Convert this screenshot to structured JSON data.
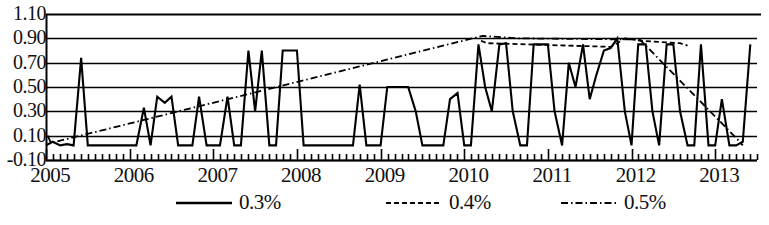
{
  "chart_data": {
    "type": "line",
    "title": "",
    "subtitle": "",
    "xlabel": "",
    "ylabel": "",
    "grid": true,
    "legend_position": "bottom",
    "ylim": [
      -0.1,
      1.1
    ],
    "ytick_labels": [
      "1.10",
      "0.90",
      "0.70",
      "0.50",
      "0.30",
      "0.10",
      "-0.10"
    ],
    "ytick_values": [
      1.1,
      0.9,
      0.7,
      0.5,
      0.3,
      0.1,
      -0.1
    ],
    "xlim": [
      2005.0,
      2013.5
    ],
    "xtick_labels": [
      "2005",
      "2006",
      "2007",
      "2008",
      "2009",
      "2010",
      "2011",
      "2012",
      "2013"
    ],
    "xtick_values": [
      2005,
      2006,
      2007,
      2008,
      2009,
      2010,
      2011,
      2012,
      2013
    ],
    "x_minor_ticks": "monthly",
    "legend": [
      {
        "name": "0.3%",
        "style": "solid",
        "color": "#000000"
      },
      {
        "name": "0.4%",
        "style": "dashed",
        "color": "#000000"
      },
      {
        "name": "0.5%",
        "style": "dash-dot",
        "color": "#000000"
      }
    ],
    "series": [
      {
        "name": "0.3%",
        "style": "solid",
        "color": "#000000",
        "x": [
          2005.0,
          2005.08,
          2005.17,
          2005.25,
          2005.33,
          2005.42,
          2005.5,
          2005.58,
          2005.67,
          2005.75,
          2005.83,
          2005.92,
          2006.0,
          2006.08,
          2006.17,
          2006.25,
          2006.33,
          2006.42,
          2006.5,
          2006.58,
          2006.67,
          2006.75,
          2006.83,
          2006.92,
          2007.0,
          2007.08,
          2007.17,
          2007.25,
          2007.33,
          2007.42,
          2007.5,
          2007.58,
          2007.67,
          2007.75,
          2007.83,
          2007.92,
          2008.0,
          2008.08,
          2008.17,
          2008.25,
          2008.33,
          2008.42,
          2008.5,
          2008.58,
          2008.67,
          2008.75,
          2008.83,
          2008.92,
          2009.0,
          2009.08,
          2009.17,
          2009.25,
          2009.33,
          2009.42,
          2009.5,
          2009.58,
          2009.67,
          2009.75,
          2009.83,
          2009.92,
          2010.0,
          2010.08,
          2010.17,
          2010.25,
          2010.33,
          2010.42,
          2010.5,
          2010.58,
          2010.67,
          2010.75,
          2010.83,
          2010.92,
          2011.0,
          2011.08,
          2011.17,
          2011.25,
          2011.33,
          2011.42,
          2011.5,
          2011.58,
          2011.67,
          2011.75,
          2011.83,
          2011.92,
          2012.0,
          2012.08,
          2012.17,
          2012.25,
          2012.33,
          2012.42,
          2012.5,
          2012.58,
          2012.67,
          2012.75,
          2012.83,
          2012.92,
          2013.0,
          2013.08,
          2013.17,
          2013.25,
          2013.33,
          2013.42
        ],
        "y": [
          0.02,
          0.05,
          0.02,
          0.03,
          0.02,
          0.74,
          0.02,
          0.02,
          0.02,
          0.02,
          0.02,
          0.02,
          0.02,
          0.02,
          0.33,
          0.02,
          0.42,
          0.37,
          0.42,
          0.02,
          0.02,
          0.02,
          0.42,
          0.02,
          0.02,
          0.02,
          0.42,
          0.02,
          0.02,
          0.8,
          0.3,
          0.8,
          0.02,
          0.02,
          0.8,
          0.8,
          0.8,
          0.02,
          0.02,
          0.02,
          0.02,
          0.02,
          0.02,
          0.02,
          0.02,
          0.52,
          0.02,
          0.02,
          0.02,
          0.5,
          0.5,
          0.5,
          0.5,
          0.3,
          0.02,
          0.02,
          0.02,
          0.02,
          0.4,
          0.45,
          0.02,
          0.02,
          0.85,
          0.5,
          0.3,
          0.85,
          0.86,
          0.3,
          0.02,
          0.02,
          0.85,
          0.85,
          0.85,
          0.3,
          0.02,
          0.7,
          0.5,
          0.85,
          0.4,
          0.6,
          0.8,
          0.82,
          0.9,
          0.3,
          0.02,
          0.85,
          0.85,
          0.3,
          0.02,
          0.85,
          0.85,
          0.3,
          0.02,
          0.02,
          0.85,
          0.02,
          0.02,
          0.4,
          0.02,
          0.02,
          0.05,
          0.85
        ]
      },
      {
        "name": "0.4%",
        "style": "dashed",
        "color": "#000000",
        "x": [
          2010.2,
          2010.27,
          2011.75,
          2011.83,
          2011.92,
          2012.12,
          2012.58,
          2012.67
        ],
        "y": [
          0.88,
          0.86,
          0.83,
          0.86,
          0.9,
          0.88,
          0.86,
          0.84
        ]
      },
      {
        "name": "0.5%",
        "style": "dash-dot",
        "color": "#000000",
        "x": [
          2005.02,
          2005.06,
          2010.22,
          2010.64,
          2012.1,
          2013.28,
          2013.33
        ],
        "y": [
          0.1,
          0.04,
          0.92,
          0.9,
          0.89,
          0.06,
          0.02
        ]
      }
    ]
  },
  "axis": {
    "y_labels": [
      "1.10",
      "0.90",
      "0.70",
      "0.50",
      "0.30",
      "0.10",
      "-0.10"
    ],
    "x_labels": [
      "2005",
      "2006",
      "2007",
      "2008",
      "2009",
      "2010",
      "2011",
      "2012",
      "2013"
    ]
  },
  "legend": {
    "items": [
      {
        "label": "0.3%",
        "style": "solid"
      },
      {
        "label": "0.4%",
        "style": "dashed"
      },
      {
        "label": "0.5%",
        "style": "dash-dot"
      }
    ]
  }
}
